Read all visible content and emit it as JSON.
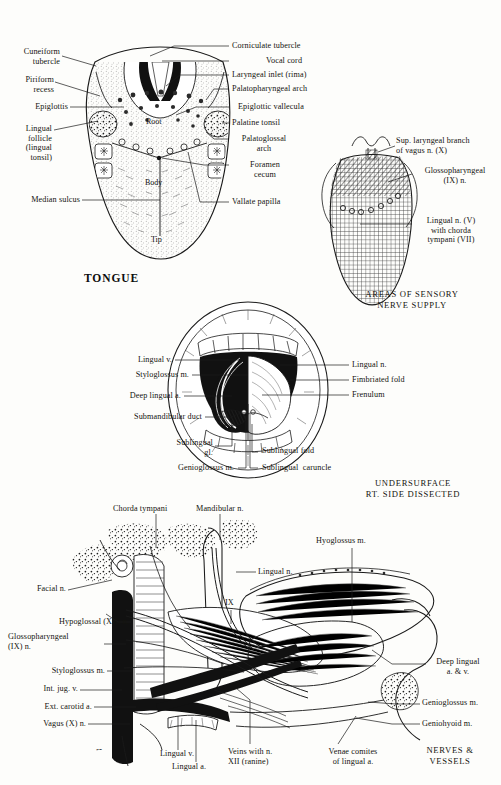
{
  "plate": {
    "width": 501,
    "height": 785,
    "background_color": "#fdfdfb",
    "ink_color": "#1a1a1a",
    "signature": "Frank H. Netter"
  },
  "figures": [
    {
      "id": "dorsum-of-tongue",
      "title": "TONGUE",
      "internal_labels": [
        {
          "text": "Root",
          "x": 152,
          "y": 122
        },
        {
          "text": "Body",
          "x": 149,
          "y": 183
        },
        {
          "text": "Tip",
          "x": 152,
          "y": 240
        }
      ],
      "left_labels": [
        {
          "text": "Cuneiform\ntubercle",
          "x": 18,
          "y": 47
        },
        {
          "text": "Piriform\nrecess",
          "x": 18,
          "y": 75
        },
        {
          "text": "Epiglottis",
          "x": 18,
          "y": 105
        },
        {
          "text": "Lingual\nfollicle\n(lingual\ntonsil)",
          "x": 18,
          "y": 127
        },
        {
          "text": "Median sulcus",
          "x": 18,
          "y": 198
        }
      ],
      "right_labels": [
        {
          "text": "Corniculate tubercle",
          "x": 232,
          "y": 45
        },
        {
          "text": "Vocal cord",
          "x": 232,
          "y": 60
        },
        {
          "text": "Laryngeal inlet (rima)",
          "x": 232,
          "y": 74
        },
        {
          "text": "Palatopharyngeal arch",
          "x": 232,
          "y": 88
        },
        {
          "text": "Epiglottic vallecula",
          "x": 232,
          "y": 106
        },
        {
          "text": "Palatine tonsil",
          "x": 232,
          "y": 122
        },
        {
          "text": "Palatoglossal\narch",
          "x": 232,
          "y": 138
        },
        {
          "text": "Foramen\ncecum",
          "x": 232,
          "y": 162
        },
        {
          "text": "Vallate papilla",
          "x": 232,
          "y": 201
        }
      ]
    },
    {
      "id": "areas-of-sensory-nerve-supply",
      "caption": "AREAS OF SENSORY\nNERVE SUPPLY",
      "labels": [
        {
          "text": "Sup. laryngeal branch\nof vagus n. (X)",
          "x": 398,
          "y": 140
        },
        {
          "text": "Glossopharyngeal\n(IX) n.",
          "x": 416,
          "y": 172
        },
        {
          "text": "Lingual n. (V)\nwith chorda\ntympani (VII)",
          "x": 416,
          "y": 222
        }
      ]
    },
    {
      "id": "undersurface-of-tongue",
      "caption": "UNDERSURFACE\nRT. SIDE DISSECTED",
      "left_labels": [
        {
          "text": "Lingual v.",
          "x": 128,
          "y": 358
        },
        {
          "text": "Styloglossus m.",
          "x": 128,
          "y": 373
        },
        {
          "text": "Deep lingual a.",
          "x": 128,
          "y": 394
        },
        {
          "text": "Submandibular duct",
          "x": 128,
          "y": 415
        }
      ],
      "right_labels": [
        {
          "text": "Lingual n.",
          "x": 352,
          "y": 363
        },
        {
          "text": "Fimbriated fold",
          "x": 352,
          "y": 378
        },
        {
          "text": "Frenulum",
          "x": 352,
          "y": 393
        }
      ],
      "bottom_labels": [
        {
          "text": "Sublingual\ngl.",
          "x": 177,
          "y": 442
        },
        {
          "text": "Genioglossus m.",
          "x": 177,
          "y": 466
        },
        {
          "text": "Sublingual fold",
          "x": 262,
          "y": 450
        },
        {
          "text": "Sublingual  caruncle",
          "x": 262,
          "y": 466
        }
      ]
    },
    {
      "id": "nerves-and-vessels",
      "caption": "NERVES &\nVESSELS",
      "top_labels": [
        {
          "text": "Chorda tympani",
          "x": 113,
          "y": 508
        },
        {
          "text": "Mandibular n.",
          "x": 197,
          "y": 508
        },
        {
          "text": "Hyoglossus m.",
          "x": 318,
          "y": 540
        }
      ],
      "left_labels": [
        {
          "text": "Facial n.",
          "x": 33,
          "y": 588
        },
        {
          "text": "Hypoglossal (XII) n.",
          "x": 33,
          "y": 620
        },
        {
          "text": "Glossopharyngeal\n(IX) n.",
          "x": 33,
          "y": 636
        },
        {
          "text": "Styloglossus m.",
          "x": 33,
          "y": 669
        },
        {
          "text": "Int. jug. v.",
          "x": 33,
          "y": 688
        },
        {
          "text": "Ext. carotid a.",
          "x": 33,
          "y": 705
        },
        {
          "text": "Vagus (X) n.",
          "x": 33,
          "y": 722
        }
      ],
      "right_labels": [
        {
          "text": "Lingual n.",
          "x": 222,
          "y": 570
        },
        {
          "text": "IX",
          "x": 224,
          "y": 604
        },
        {
          "text": "Deep lingual\na. & v.",
          "x": 428,
          "y": 662
        },
        {
          "text": "Genioglossus m.",
          "x": 422,
          "y": 701
        },
        {
          "text": "Geniohyoid m.",
          "x": 422,
          "y": 722
        }
      ],
      "bottom_labels": [
        {
          "text": "Lingual v.",
          "x": 165,
          "y": 753
        },
        {
          "text": "Lingual a.",
          "x": 170,
          "y": 766
        },
        {
          "text": "Veins with n.\nXII (ranine)",
          "x": 230,
          "y": 750
        },
        {
          "text": "Venae comites\nof lingual a.",
          "x": 322,
          "y": 750
        }
      ]
    }
  ]
}
